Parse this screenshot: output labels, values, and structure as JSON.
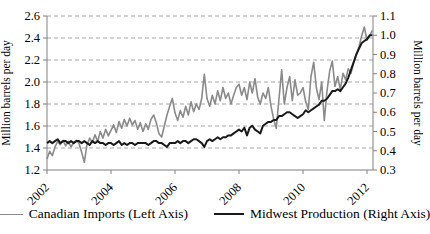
{
  "chart_data": {
    "type": "line",
    "title": "",
    "x_start": "2002-01",
    "x_interval": "monthly",
    "x_tick_years": [
      2002,
      2004,
      2006,
      2008,
      2010,
      2012
    ],
    "x_tick_labels": [
      "2002",
      "2004",
      "2006",
      "2008",
      "2010",
      "2012"
    ],
    "grid": "horizontal-dashed",
    "legend_position": "bottom",
    "left_axis": {
      "label": "Million barrels per day",
      "min": 1.2,
      "max": 2.6,
      "step": 0.2,
      "tick_labels": [
        "1.2",
        "1.4",
        "1.6",
        "1.8",
        "2.0",
        "2.2",
        "2.4",
        "2.6"
      ]
    },
    "right_axis": {
      "label": "Million barrels per day",
      "min": 0.3,
      "max": 1.1,
      "step": 0.1,
      "tick_labels": [
        "0.3",
        "0.4",
        "0.5",
        "0.6",
        "0.7",
        "0.8",
        "0.9",
        "1.0",
        "1.1"
      ]
    },
    "series": [
      {
        "name": "Canadian Imports (Left Axis)",
        "axis": "left",
        "color": "#8a8a8a",
        "stroke_width": 1.6,
        "values": [
          1.3,
          1.37,
          1.33,
          1.41,
          1.46,
          1.43,
          1.47,
          1.42,
          1.46,
          1.41,
          1.45,
          1.47,
          1.44,
          1.36,
          1.27,
          1.43,
          1.49,
          1.45,
          1.52,
          1.46,
          1.55,
          1.49,
          1.57,
          1.51,
          1.56,
          1.61,
          1.54,
          1.64,
          1.58,
          1.66,
          1.6,
          1.67,
          1.61,
          1.65,
          1.57,
          1.63,
          1.55,
          1.62,
          1.57,
          1.66,
          1.7,
          1.63,
          1.53,
          1.5,
          1.6,
          1.7,
          1.78,
          1.85,
          1.72,
          1.65,
          1.74,
          1.68,
          1.78,
          1.7,
          1.82,
          1.73,
          1.8,
          1.75,
          1.85,
          2.07,
          1.85,
          1.78,
          1.88,
          1.8,
          1.92,
          1.83,
          1.95,
          1.85,
          1.9,
          1.8,
          1.88,
          1.95,
          1.98,
          1.88,
          1.95,
          1.84,
          2.0,
          1.9,
          2.03,
          1.86,
          1.8,
          1.9,
          1.85,
          1.95,
          1.78,
          1.66,
          1.58,
          1.85,
          2.11,
          1.8,
          1.95,
          2.05,
          1.83,
          2.02,
          1.88,
          1.9,
          1.95,
          1.82,
          1.75,
          2.05,
          2.18,
          1.95,
          1.84,
          2.0,
          1.65,
          1.92,
          2.1,
          2.19,
          1.96,
          2.05,
          1.93,
          2.08,
          2.02,
          2.12,
          2.08,
          2.18,
          2.25,
          2.32,
          2.42,
          2.5,
          2.38,
          2.42,
          2.47
        ]
      },
      {
        "name": "Midwest Production (Right Axis)",
        "axis": "right",
        "color": "#1a1a1a",
        "stroke_width": 2.0,
        "values": [
          0.44,
          0.45,
          0.44,
          0.45,
          0.46,
          0.44,
          0.45,
          0.45,
          0.44,
          0.45,
          0.44,
          0.45,
          0.45,
          0.44,
          0.45,
          0.44,
          0.43,
          0.45,
          0.44,
          0.45,
          0.44,
          0.44,
          0.43,
          0.44,
          0.44,
          0.43,
          0.44,
          0.45,
          0.43,
          0.44,
          0.43,
          0.44,
          0.44,
          0.43,
          0.44,
          0.44,
          0.44,
          0.44,
          0.43,
          0.44,
          0.45,
          0.45,
          0.44,
          0.44,
          0.43,
          0.42,
          0.44,
          0.44,
          0.44,
          0.45,
          0.44,
          0.45,
          0.45,
          0.44,
          0.45,
          0.46,
          0.46,
          0.45,
          0.44,
          0.42,
          0.45,
          0.46,
          0.45,
          0.46,
          0.47,
          0.46,
          0.47,
          0.47,
          0.48,
          0.48,
          0.49,
          0.5,
          0.51,
          0.5,
          0.52,
          0.48,
          0.52,
          0.53,
          0.51,
          0.5,
          0.49,
          0.53,
          0.54,
          0.55,
          0.55,
          0.56,
          0.56,
          0.58,
          0.58,
          0.59,
          0.6,
          0.6,
          0.59,
          0.58,
          0.57,
          0.58,
          0.59,
          0.61,
          0.6,
          0.61,
          0.62,
          0.63,
          0.64,
          0.66,
          0.66,
          0.67,
          0.69,
          0.71,
          0.71,
          0.72,
          0.71,
          0.73,
          0.75,
          0.78,
          0.82,
          0.86,
          0.9,
          0.93,
          0.96,
          0.97,
          0.98,
          1.0,
          1.0
        ]
      }
    ]
  },
  "legend": {
    "items": [
      {
        "label": "Canadian Imports (Left Axis)"
      },
      {
        "label": "Midwest Production (Right Axis)"
      }
    ]
  }
}
